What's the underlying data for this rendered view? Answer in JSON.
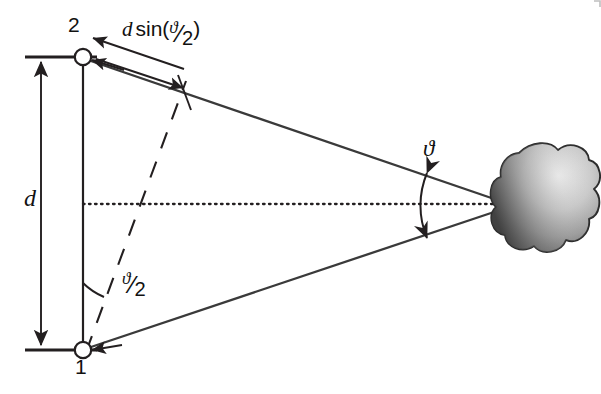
{
  "figure": {
    "type": "diagram",
    "background_color": "#ffffff",
    "ink_color": "#231f20",
    "labels": {
      "antenna_top": "2",
      "antenna_bottom": "1",
      "baseline": "d",
      "path_difference_prefix": "d",
      "path_difference_func": "sin(",
      "path_difference_close": ")",
      "theta_symbol": "ϑ",
      "half_slash": "⁄",
      "half_den": "2",
      "apex_angle": "ϑ",
      "half_angle_numerator": "ϑ",
      "half_angle_denominator": "2"
    },
    "elements": {
      "source_name": "cloud-source",
      "source_fill_dark": "#4a4a4a",
      "source_fill_light": "#d8d8d8",
      "center_axis_style": "dotted",
      "wavefront_style": "dashed"
    },
    "geometry": {
      "antenna_top_xy": [
        83,
        57
      ],
      "antenna_bottom_xy": [
        83,
        350
      ],
      "apex_xy": [
        508,
        205
      ],
      "baseline_length_px": 293,
      "center_axis_y": 204,
      "dimension_line_x": 41,
      "tick_left_x": 25,
      "tick_right_x": 97,
      "apex_angle_deg": 34,
      "half_angle_deg": 17
    }
  }
}
